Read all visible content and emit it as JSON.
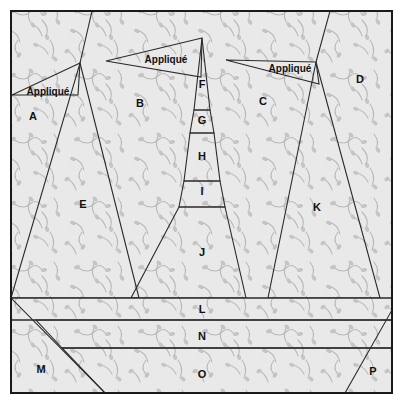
{
  "block": {
    "title": "Pieced tree quilt block piecing diagram",
    "width": 403,
    "height": 404,
    "background_color": "#ffffff",
    "outline_color": "#1a1a1a",
    "seam_color": "#2b2b2b"
  },
  "fabrics": {
    "background_print": {
      "name": "light-vine-print",
      "base_color": "#e9e9e9",
      "motif_color": "#b9b9b9"
    },
    "tree_dot_medium": {
      "name": "medium-gray-dot",
      "base_color": "#bdbdbd",
      "dot_color": "#ffffff"
    },
    "trunk_solid": {
      "name": "medium-gray-solid",
      "base_color": "#c9c9c9"
    },
    "trunk_dark": {
      "name": "dark-gray-solid",
      "base_color": "#a8a8a8"
    },
    "white_solid": {
      "name": "white-solid",
      "base_color": "#ffffff"
    },
    "band_dark_dot": {
      "name": "dark-gray-dot",
      "base_color": "#a6a6a6",
      "dot_color": "#ffffff"
    },
    "band_white_dot": {
      "name": "white-small-dot",
      "base_color": "#fdfdfd",
      "dot_color": "#c4c4c4"
    }
  },
  "pieces": [
    {
      "id": "A",
      "label": "A",
      "fabric": "background_print",
      "label_x": 33,
      "label_y": 117
    },
    {
      "id": "B",
      "label": "B",
      "fabric": "background_print",
      "label_x": 140,
      "label_y": 104
    },
    {
      "id": "C",
      "label": "C",
      "fabric": "background_print",
      "label_x": 263,
      "label_y": 102
    },
    {
      "id": "D",
      "label": "D",
      "fabric": "background_print",
      "label_x": 360,
      "label_y": 80
    },
    {
      "id": "E",
      "label": "E",
      "fabric": "tree_dot_medium",
      "label_x": 83,
      "label_y": 205
    },
    {
      "id": "F",
      "label": "F",
      "fabric": "trunk_dark",
      "label_x": 202,
      "label_y": 85
    },
    {
      "id": "G",
      "label": "G",
      "fabric": "white_solid",
      "label_x": 202,
      "label_y": 121
    },
    {
      "id": "H",
      "label": "H",
      "fabric": "trunk_dark",
      "label_x": 202,
      "label_y": 157
    },
    {
      "id": "I",
      "label": "I",
      "fabric": "white_solid",
      "label_x": 202,
      "label_y": 192
    },
    {
      "id": "J",
      "label": "J",
      "fabric": "trunk_solid",
      "label_x": 202,
      "label_y": 253
    },
    {
      "id": "K",
      "label": "K",
      "fabric": "tree_dot_medium",
      "label_x": 317,
      "label_y": 208
    },
    {
      "id": "L",
      "label": "L",
      "fabric": "band_dark_dot",
      "label_x": 202,
      "label_y": 310
    },
    {
      "id": "M",
      "label": "M",
      "fabric": "background_print",
      "label_x": 41,
      "label_y": 370
    },
    {
      "id": "N",
      "label": "N",
      "fabric": "band_white_dot",
      "label_x": 202,
      "label_y": 337
    },
    {
      "id": "O",
      "label": "O",
      "fabric": "band_dark_dot",
      "label_x": 202,
      "label_y": 375
    },
    {
      "id": "P",
      "label": "P",
      "fabric": "background_print",
      "label_x": 373,
      "label_y": 372
    }
  ],
  "applique_labels": [
    {
      "id": "applique-left",
      "text": "Appliqué",
      "x": 48,
      "y": 92
    },
    {
      "id": "applique-center",
      "text": "Appliqué",
      "x": 166,
      "y": 60
    },
    {
      "id": "applique-right",
      "text": "Appliqué",
      "x": 290,
      "y": 69
    }
  ]
}
